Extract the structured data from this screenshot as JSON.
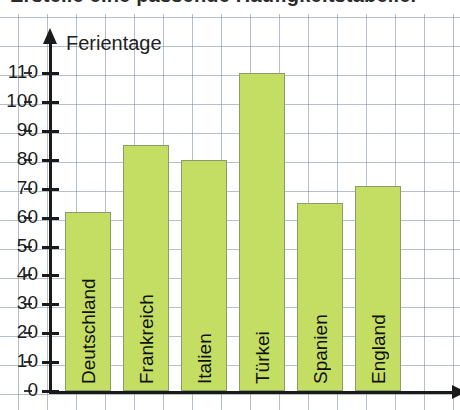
{
  "header": {
    "instruction": "Erstelle eine passende Häufigkeitstabelle."
  },
  "chart_data": {
    "type": "bar",
    "title": "",
    "ylabel": "Ferientage",
    "xlabel": "",
    "categories": [
      "Deutschland",
      "Frankreich",
      "Italien",
      "Türkei",
      "Spanien",
      "England"
    ],
    "values": [
      62,
      85,
      80,
      110,
      65,
      71
    ],
    "ylim": [
      0,
      110
    ],
    "ytick_step": 10,
    "ytick_labels": [
      "0",
      "10",
      "20",
      "30",
      "40",
      "50",
      "60",
      "70",
      "80",
      "90",
      "100",
      "110"
    ],
    "grid": true,
    "grid_style": "graph-paper",
    "legend": "none",
    "bar_color": "#c4de63",
    "bar_border_color": "#8d9b6a",
    "axis_color": "#1a1a1a",
    "grid_color": "#7b8ca5",
    "y_axis_has_arrow": true,
    "x_axis_has_arrow": true,
    "labels_inside_bars": true,
    "label_orientation": "vertical"
  }
}
